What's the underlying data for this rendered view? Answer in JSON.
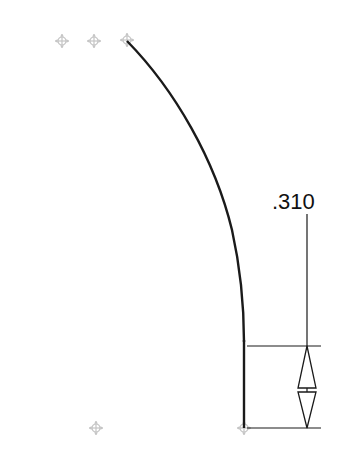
{
  "sketch": {
    "dimension": {
      "label": ".310",
      "type": "vertical-linear"
    },
    "points": [
      {
        "name": "point-1",
        "x": 62,
        "y": 41
      },
      {
        "name": "point-2",
        "x": 94,
        "y": 41
      },
      {
        "name": "point-3",
        "x": 127,
        "y": 40
      },
      {
        "name": "point-4",
        "x": 96,
        "y": 428
      },
      {
        "name": "point-5",
        "x": 244,
        "y": 428
      }
    ],
    "colors": {
      "geometry": "#1a1a1a",
      "point_marker": "#bdbdbd",
      "background": "#ffffff"
    }
  }
}
